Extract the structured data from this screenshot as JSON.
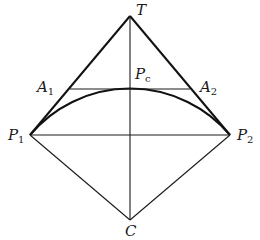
{
  "figure": {
    "points": {
      "T": {
        "x": 130,
        "y": 16
      },
      "P1": {
        "x": 30,
        "y": 135
      },
      "P2": {
        "x": 230,
        "y": 135
      },
      "C": {
        "x": 130,
        "y": 220
      },
      "Pc": {
        "x": 130,
        "y": 89
      },
      "A1": {
        "x": 70,
        "y": 89
      },
      "A2": {
        "x": 190,
        "y": 89
      }
    },
    "labels": {
      "T": {
        "main": "T",
        "sub": ""
      },
      "P1": {
        "main": "P",
        "sub": "1"
      },
      "P2": {
        "main": "P",
        "sub": "2"
      },
      "C": {
        "main": "C",
        "sub": ""
      },
      "Pc": {
        "main": "P",
        "sub": "c"
      },
      "A1": {
        "main": "A",
        "sub": "1"
      },
      "A2": {
        "main": "A",
        "sub": "2"
      }
    },
    "colors": {
      "line": "#1a1a1a",
      "background": "#ffffff"
    }
  }
}
